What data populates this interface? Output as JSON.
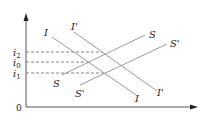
{
  "diagram": {
    "type": "IS-curve shift diagram",
    "axis": {
      "origin_label": "0"
    },
    "y_ticks": [
      {
        "label": "i",
        "sub": "2",
        "y": 52
      },
      {
        "label": "i",
        "sub": "0",
        "y": 62
      },
      {
        "label": "i",
        "sub": "1",
        "y": 73
      }
    ],
    "curves": {
      "I": {
        "start_label": "I",
        "end_label": "I"
      },
      "Ip": {
        "start_label": "I'",
        "end_label": "I'"
      },
      "S": {
        "start_label": "S",
        "end_label": "S"
      },
      "Sp": {
        "start_label": "S'",
        "end_label": "S'"
      }
    },
    "colors": {
      "axis": "#555555",
      "curve": "#9a9a9a",
      "dash": "#666666",
      "text": "#222222"
    }
  }
}
